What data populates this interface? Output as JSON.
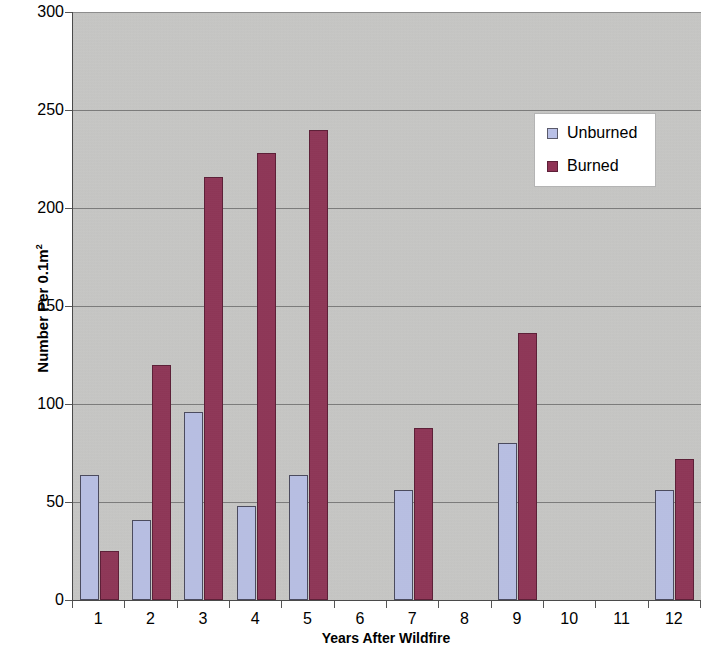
{
  "chart_data": {
    "type": "bar",
    "title": "",
    "subtitle": "",
    "xlabel": "Years After Wildfire",
    "ylabel": "Number Per 0.1m²",
    "ylabel_base": "Number Per 0.1m",
    "ylabel_exponent": "2",
    "categories": [
      "1",
      "2",
      "3",
      "4",
      "5",
      "6",
      "7",
      "8",
      "9",
      "10",
      "11",
      "12"
    ],
    "series": [
      {
        "name": "Unburned",
        "color": "#b9c0e6",
        "values": [
          64,
          41,
          96,
          48,
          64,
          null,
          56,
          null,
          80,
          null,
          null,
          56
        ]
      },
      {
        "name": "Burned",
        "color": "#8f3355",
        "values": [
          25,
          120,
          216,
          228,
          240,
          null,
          88,
          null,
          136,
          null,
          null,
          72
        ]
      }
    ],
    "ylim": [
      0,
      300
    ],
    "ytick_values": [
      0,
      50,
      100,
      150,
      200,
      250,
      300
    ],
    "ytick_labels": [
      "0",
      "50",
      "100",
      "150",
      "200",
      "250",
      "300"
    ],
    "grid": true,
    "grid_axis": "y",
    "legend": {
      "position": "upper-right",
      "entries": [
        {
          "label": "Unburned",
          "swatch": "unburned"
        },
        {
          "label": "Burned",
          "swatch": "burned"
        }
      ]
    },
    "plot_background": "#c9c9c7"
  }
}
